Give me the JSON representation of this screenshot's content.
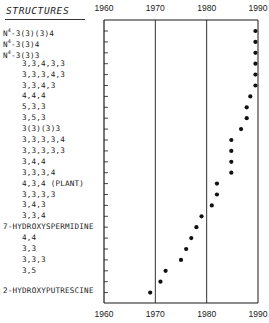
{
  "chart_data": {
    "type": "scatter",
    "title": "",
    "header": "STRUCTURES",
    "xlabel": "",
    "ylabel": "STRUCTURES",
    "xlim": [
      1960,
      1990
    ],
    "x_ticks": [
      "1960",
      "1970",
      "1980",
      "1990"
    ],
    "grid": {
      "vertical_lines_at": [
        1970,
        1980
      ]
    },
    "legend": null,
    "rows": [
      {
        "label": "N4-3(3)(3)4",
        "year": 1989.5
      },
      {
        "label": "N4-3(3)4",
        "year": 1989.5
      },
      {
        "label": "N4-3(3)3",
        "year": 1989.5
      },
      {
        "label": "3,3,4,3,3",
        "year": 1989.5
      },
      {
        "label": "3,3,3,4,3",
        "year": 1989.5
      },
      {
        "label": "3,3,4,3",
        "year": 1989.5
      },
      {
        "label": "4,4,4",
        "year": 1988.5
      },
      {
        "label": "5,3,3",
        "year": 1987.8
      },
      {
        "label": "3,5,3",
        "year": 1987.8
      },
      {
        "label": "3(3)(3)3",
        "year": 1986.7
      },
      {
        "label": "3,3,3,3,4",
        "year": 1984.8
      },
      {
        "label": "3,3,3,3,3",
        "year": 1984.8
      },
      {
        "label": "3,4,4",
        "year": 1984.8
      },
      {
        "label": "3,3,3,4",
        "year": 1984.8
      },
      {
        "label": "4,3,4 (PLANT)",
        "year": 1982.0
      },
      {
        "label": "3,3,3,3",
        "year": 1982.0
      },
      {
        "label": "3,4,3",
        "year": 1981.0
      },
      {
        "label": "3,3,4",
        "year": 1979.0
      },
      {
        "label": "7-HYDROXYSPERMIDINE",
        "year": 1978.0
      },
      {
        "label": "4,4",
        "year": 1977.0
      },
      {
        "label": "3,3",
        "year": 1976.0
      },
      {
        "label": "3,3,3",
        "year": 1975.0
      },
      {
        "label": "3,5",
        "year": 1972.0
      },
      {
        "label": "",
        "year": 1971.0
      },
      {
        "label": "2-HYDROXYPUTRESCINE",
        "year": 1969.0
      }
    ]
  },
  "header": {
    "title": "STRUCTURES"
  },
  "axis": {
    "top_ticks": [
      "1960",
      "1970",
      "1980",
      "1990"
    ],
    "bottom_ticks": [
      "1960",
      "1970",
      "1980",
      "1990"
    ]
  },
  "colors": {
    "ink": "#1a1a1a",
    "dot": "#111111",
    "background": "#ffffff"
  }
}
